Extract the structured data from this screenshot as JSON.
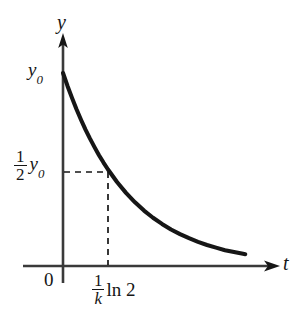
{
  "figure": {
    "kind": "exponential-decay-graph",
    "background_color": "#ffffff",
    "ink_color": "#161616"
  },
  "labels": {
    "y_axis": "y",
    "t_axis": "t",
    "origin": "0",
    "initial_value": "y",
    "initial_value_sub": "0",
    "half_value_num": "1",
    "half_value_den": "2",
    "half_value_tail": "y",
    "half_value_tail_sub": "0",
    "halflife_num": "1",
    "halflife_den": "k",
    "halflife_tail": "ln 2"
  },
  "chart_data": {
    "type": "line",
    "title": "",
    "xlabel": "t",
    "ylabel": "y",
    "grid": false,
    "legend": false,
    "function": "y = y0 * exp(-k t)",
    "xlim": [
      0,
      4.8
    ],
    "ylim": [
      0,
      1.12
    ],
    "x_tick_labels": [
      "0",
      "(1/k) ln 2"
    ],
    "x_tick_values": [
      0,
      1
    ],
    "y_tick_labels": [
      "y0",
      "(1/2) y0"
    ],
    "y_tick_values": [
      1,
      0.5
    ],
    "annotations": [
      {
        "name": "horizontal-dashed-guide",
        "from": [
          0,
          0.5
        ],
        "to": [
          1,
          0.5
        ],
        "style": "dashed"
      },
      {
        "name": "vertical-dashed-guide",
        "from": [
          1,
          0.5
        ],
        "to": [
          1,
          0
        ],
        "style": "dashed"
      }
    ],
    "series": [
      {
        "name": "decay-curve",
        "color": "#161616",
        "x": [
          0,
          0.1,
          0.2,
          0.3,
          0.4,
          0.5,
          0.6,
          0.7,
          0.8,
          0.9,
          1.0,
          1.2,
          1.4,
          1.6,
          1.8,
          2.0,
          2.2,
          2.4,
          2.6,
          2.8,
          3.0,
          3.2,
          3.4,
          3.6,
          3.8,
          4.0,
          4.05
        ],
        "y": [
          1.0,
          0.933,
          0.871,
          0.812,
          0.758,
          0.707,
          0.66,
          0.616,
          0.574,
          0.536,
          0.5,
          0.435,
          0.379,
          0.33,
          0.287,
          0.25,
          0.218,
          0.189,
          0.165,
          0.144,
          0.125,
          0.109,
          0.095,
          0.082,
          0.072,
          0.063,
          0.061
        ]
      }
    ]
  }
}
